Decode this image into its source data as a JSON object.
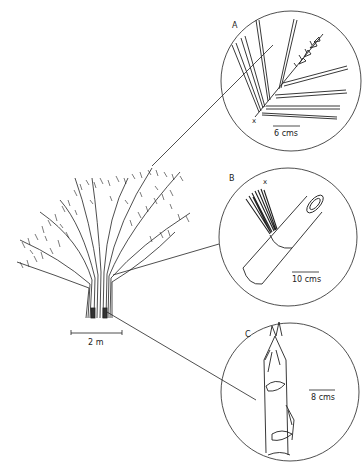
{
  "figure": {
    "type": "botanical-illustration",
    "main_plant": {
      "scale_label": "2 m"
    },
    "panels": [
      {
        "id": "A",
        "label": "A",
        "scale_label": "6 cms",
        "marker": "x",
        "depicts": "leafy branch with flowering tip"
      },
      {
        "id": "B",
        "label": "B",
        "scale_label": "10 cms",
        "marker": "x",
        "depicts": "culm segment with branch tuft at node"
      },
      {
        "id": "C",
        "label": "C",
        "scale_label": "8 cms",
        "depicts": "young shoot with culm sheaths"
      }
    ]
  }
}
